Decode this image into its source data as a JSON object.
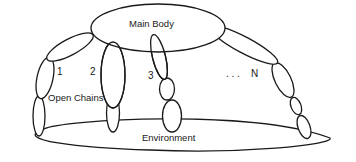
{
  "diagram": {
    "type": "multi-body schematic",
    "labels": {
      "main_body": "Main Body",
      "environment": "Environment",
      "open_chains": "Open Chains",
      "chain_1": "1",
      "chain_2": "2",
      "chain_3": "3",
      "ellipsis": ". . .",
      "chain_n": "N"
    },
    "colors": {
      "stroke": "#1a1a1a",
      "fill": "#ffffff",
      "background": "#ffffff"
    },
    "nodes": [
      {
        "id": "main-body",
        "label": "Main Body",
        "shape": "ellipse"
      },
      {
        "id": "environment",
        "label": "Environment",
        "shape": "ellipse"
      },
      {
        "id": "chain-1",
        "label": "1",
        "links": 3
      },
      {
        "id": "chain-2",
        "label": "2",
        "links": 2
      },
      {
        "id": "chain-3",
        "label": "3",
        "links": 3
      },
      {
        "id": "chain-n",
        "label": "N",
        "links": 4
      }
    ]
  }
}
